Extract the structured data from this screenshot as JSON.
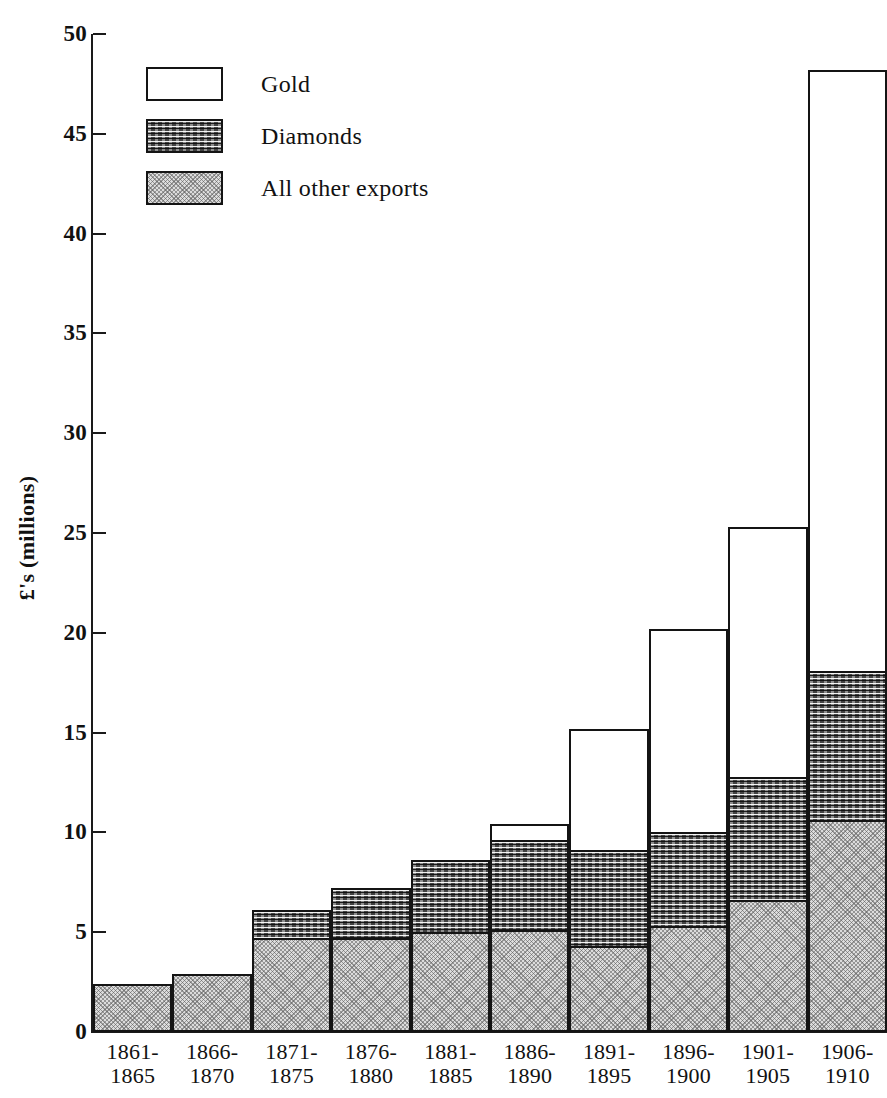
{
  "chart_data": {
    "type": "bar",
    "subtype": "stacked-bar",
    "title": "",
    "xlabel": "",
    "ylabel": "£'s (millions)",
    "ylim": [
      0,
      50
    ],
    "ytick_values": [
      0,
      5,
      10,
      15,
      20,
      25,
      30,
      35,
      40,
      45,
      50
    ],
    "ytick_labels": [
      "0",
      "5",
      "10",
      "15",
      "20",
      "25",
      "30",
      "35",
      "40",
      "45",
      "50"
    ],
    "grid": false,
    "legend_position": "upper-left-inside",
    "categories": [
      "1861-1865",
      "1866-1870",
      "1871-1875",
      "1876-1880",
      "1881-1885",
      "1886-1890",
      "1891-1895",
      "1896-1900",
      "1901-1905",
      "1906-1910"
    ],
    "category_lines": [
      [
        "1861-",
        "1865"
      ],
      [
        "1866-",
        "1870"
      ],
      [
        "1871-",
        "1875"
      ],
      [
        "1876-",
        "1880"
      ],
      [
        "1881-",
        "1885"
      ],
      [
        "1886-",
        "1890"
      ],
      [
        "1891-",
        "1895"
      ],
      [
        "1896-",
        "1900"
      ],
      [
        "1901-",
        "1905"
      ],
      [
        "1906-",
        "1910"
      ]
    ],
    "stack_order_bottom_to_top": [
      "All other exports",
      "Diamonds",
      "Gold"
    ],
    "series": [
      {
        "name": "All other exports",
        "key": "other",
        "fill": "light-stipple",
        "values": [
          2.3,
          2.8,
          4.6,
          4.6,
          4.9,
          5.0,
          4.2,
          5.2,
          6.5,
          10.5
        ]
      },
      {
        "name": "Diamonds",
        "key": "diamonds",
        "fill": "dark-wavy",
        "values": [
          0,
          0,
          1.4,
          2.5,
          3.6,
          4.5,
          4.8,
          4.7,
          6.2,
          7.5
        ]
      },
      {
        "name": "Gold",
        "key": "gold",
        "fill": "white",
        "values": [
          0,
          0,
          0,
          0,
          0,
          0.8,
          6.1,
          10.2,
          12.5,
          30.1
        ]
      }
    ],
    "totals": [
      2.3,
      2.8,
      6.0,
      7.1,
      8.5,
      10.3,
      15.1,
      20.1,
      25.2,
      48.1
    ]
  },
  "legend": {
    "items": [
      {
        "label": "Gold",
        "key": "gold"
      },
      {
        "label": "Diamonds",
        "key": "diamonds"
      },
      {
        "label": "All other exports",
        "key": "other"
      }
    ]
  },
  "axis": {
    "y_title": "£'s (millions)"
  },
  "colors": {
    "ink": "#141414",
    "gold_fill": "#ffffff",
    "diamond_fill": "#5e5e5e",
    "other_fill": "#dcdcdc",
    "page_background": "#ffffff"
  }
}
